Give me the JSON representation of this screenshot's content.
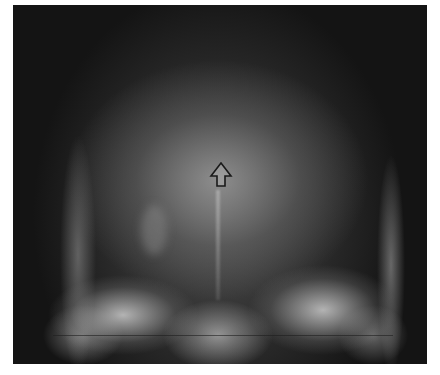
{
  "image": {
    "type": "skull radiograph (frontal/PA view)",
    "annotation": {
      "icon": "up-arrow-icon",
      "description": "outlined upward arrow marking central region"
    },
    "colors": {
      "background": "#141414",
      "bone": "#d8d8d8",
      "arrow_stroke": "#1a1a1a"
    }
  }
}
